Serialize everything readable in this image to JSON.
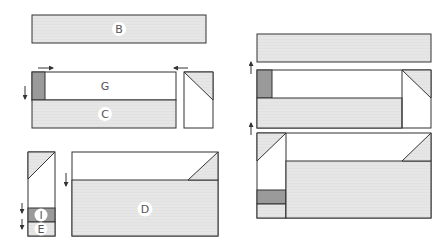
{
  "colors": {
    "light": "#e6e6e6",
    "dark": "#9a9a9a",
    "white": "#ffffff",
    "stroke": "#333333",
    "label_bg": "#ffffff"
  },
  "labels": {
    "B": "B",
    "G": "G",
    "C": "C",
    "D": "D",
    "I": "I",
    "E": "E"
  },
  "arrows": [
    {
      "id": "arrow-top-left",
      "direction": "right"
    },
    {
      "id": "arrow-top-right",
      "direction": "left"
    },
    {
      "id": "arrow-left-gc",
      "direction": "down"
    },
    {
      "id": "arrow-left-i",
      "direction": "down"
    },
    {
      "id": "arrow-left-e",
      "direction": "down"
    },
    {
      "id": "arrow-d",
      "direction": "down"
    },
    {
      "id": "arrow-right-top",
      "direction": "up"
    },
    {
      "id": "arrow-right-mid",
      "direction": "up"
    }
  ]
}
